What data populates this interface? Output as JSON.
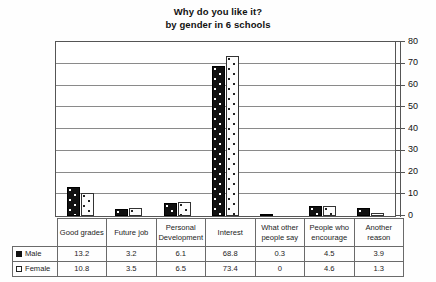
{
  "chart_data": {
    "type": "bar",
    "title": "Why do you like it?\nby gender in 6 schools",
    "title_lines": [
      "Why do you like it?",
      "by gender in 6 schools"
    ],
    "xlabel": "",
    "ylabel": "",
    "ylim": [
      0,
      80
    ],
    "yticks": [
      0,
      10,
      20,
      30,
      40,
      50,
      60,
      70,
      80
    ],
    "ytick_labels": [
      "0",
      "10",
      "20",
      "30",
      "40",
      "50",
      "60",
      "70",
      "80"
    ],
    "grid": true,
    "grid_axis": "y",
    "axis_position": "right",
    "legend": "data-table",
    "categories": [
      "Good grades",
      "Future job",
      "Personal Development",
      "Interest",
      "What other people say",
      "People who encourage",
      "Another reason"
    ],
    "series": [
      {
        "name": "Male",
        "marker": "filled-square",
        "color": "#111111",
        "pattern": "black-with-white-dots",
        "values": [
          13.2,
          3.2,
          6.1,
          68.8,
          0.3,
          4.5,
          3.9
        ],
        "value_labels": [
          "13.2",
          "3.2",
          "6.1",
          "68.8",
          "0.3",
          "4.5",
          "3.9"
        ]
      },
      {
        "name": "Female",
        "marker": "open-square",
        "color": "#ffffff",
        "pattern": "white-with-black-dots",
        "values": [
          10.8,
          3.5,
          6.5,
          73.4,
          0.0,
          4.6,
          1.3
        ],
        "value_labels": [
          "10.8",
          "3.5",
          "6.5",
          "73.4",
          "0",
          "4.6",
          "1.3"
        ]
      }
    ]
  },
  "table": {
    "category_headers": [
      "Good grades",
      "Future job",
      "Personal Development",
      "Interest",
      "What other people say",
      "People who encourage",
      "Another reason"
    ],
    "rows": [
      {
        "label": "Male",
        "values": [
          "13.2",
          "3.2",
          "6.1",
          "68.8",
          "0.3",
          "4.5",
          "3.9"
        ]
      },
      {
        "label": "Female",
        "values": [
          "10.8",
          "3.5",
          "6.5",
          "73.4",
          "0",
          "4.6",
          "1.3"
        ]
      }
    ]
  }
}
